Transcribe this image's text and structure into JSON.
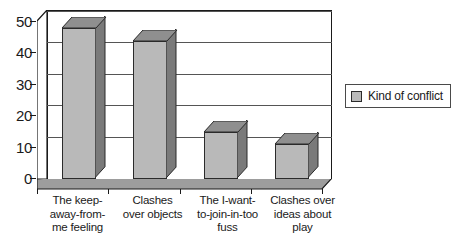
{
  "chart_data": {
    "type": "bar",
    "title": "",
    "subtitle": "",
    "xlabel": "",
    "ylabel": "",
    "categories": [
      "The keep-away-from-me feeling",
      "Clashes over objects",
      "The I-want-to-join-in-too fuss",
      "Clashes over ideas about play"
    ],
    "category_lines": [
      [
        "The keep-",
        "away-from-",
        "me feeling"
      ],
      [
        "Clashes",
        "over objects"
      ],
      [
        "The I-want-",
        "to-join-in-too",
        "fuss"
      ],
      [
        "Clashes over",
        "ideas about",
        "play"
      ]
    ],
    "series": [
      {
        "name": "Kind of conflict",
        "values": [
          48,
          44,
          15,
          11
        ]
      }
    ],
    "values": [
      48,
      44,
      15,
      11
    ],
    "ylim": [
      0,
      50
    ],
    "yticks": [
      0,
      10,
      20,
      30,
      40,
      50
    ],
    "ytick_labels": [
      "0",
      "10",
      "20",
      "30",
      "40",
      "50"
    ],
    "grid": true,
    "grid_axis": "y",
    "legend": {
      "position": "right",
      "entries": [
        {
          "label": "Kind of conflict",
          "swatch_name": "legend-swatch-kind-of-conflict"
        }
      ]
    },
    "style": {
      "three_d": true,
      "bar_face_color": "#b9b9b9",
      "bar_side_color": "#7a7a7a",
      "bar_top_color": "#8f8f8f",
      "outline_color": "#2b2b2b",
      "gridline_color": "#555555",
      "axis_color": "#1a1a1a",
      "floor_color": "#9d9d9d",
      "background_color": "#ffffff"
    }
  }
}
